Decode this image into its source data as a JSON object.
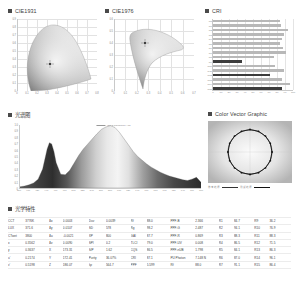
{
  "panels": {
    "cie1931": {
      "title": "CIE1931"
    },
    "cie1976": {
      "title": "CIE1976"
    },
    "cri": {
      "title": "CRI"
    },
    "spectrum": {
      "title": "光谱图"
    },
    "color_vector": {
      "title": "Color Vector Graphic"
    },
    "photometric": {
      "title": "光学特性"
    }
  },
  "cie1931_axes": {
    "xticks": [
      "0",
      "0.1",
      "0.2",
      "0.3",
      "0.4",
      "0.5",
      "0.6",
      "0.7",
      "0.8"
    ],
    "yticks": [
      "0.9",
      "0.8",
      "0.7",
      "0.6",
      "0.5",
      "0.4",
      "0.3",
      "0.2",
      "0.1",
      "0"
    ],
    "point": {
      "x": 0.3562,
      "y": 0.3637
    }
  },
  "cie1976_axes": {
    "xticks": [
      "0",
      "0.1",
      "0.2",
      "0.3",
      "0.4",
      "0.5",
      "0.6",
      "0.7"
    ],
    "yticks": [
      "0.6",
      "0.5",
      "0.4",
      "0.3",
      "0.2",
      "0.1",
      "0"
    ],
    "point": {
      "u": 0.2174,
      "v": 0.5198
    }
  },
  "chart_data": [
    {
      "type": "bar",
      "title": "CRI",
      "orientation": "horizontal",
      "categories": [
        "Ra",
        "R1",
        "R2",
        "R3",
        "R4",
        "R5",
        "R6",
        "R7",
        "R8",
        "R9",
        "R10",
        "R11",
        "R12",
        "R13",
        "R14",
        "R15"
      ],
      "values": [
        84.2,
        84.7,
        94.1,
        88.3,
        86.5,
        84.1,
        87.0,
        91.1,
        75.8,
        36.2,
        76.9,
        88.3,
        71.5,
        86.3,
        96.1,
        86.4
      ],
      "xlabel": "",
      "ylabel": "",
      "xlim": [
        0,
        100
      ],
      "xticks": [
        "0",
        "10",
        "20",
        "30",
        "40",
        "50",
        "60",
        "70",
        "80",
        "90",
        "100"
      ],
      "grid": true,
      "legend": ""
    },
    {
      "type": "area",
      "title": "光谱图",
      "series_label": "Nm = 0.2841907×12",
      "xlabel": "",
      "ylabel": "",
      "xlim": [
        380,
        780
      ],
      "ylim": [
        0,
        1
      ],
      "xticks": [
        "380",
        "400",
        "420",
        "440",
        "460",
        "480",
        "500",
        "520",
        "540",
        "560",
        "580",
        "600",
        "620",
        "640",
        "660",
        "680",
        "700",
        "720",
        "740",
        "760",
        "780"
      ],
      "yticks": [
        "1.0",
        "0.9",
        "0.8",
        "0.7",
        "0.6",
        "0.5",
        "0.4",
        "0.3",
        "0.2",
        "0.1",
        "0"
      ],
      "x": [
        380,
        390,
        400,
        410,
        420,
        430,
        440,
        445,
        450,
        455,
        460,
        470,
        480,
        490,
        500,
        510,
        520,
        530,
        540,
        550,
        560,
        570,
        580,
        590,
        600,
        610,
        620,
        630,
        640,
        650,
        660,
        670,
        680,
        690,
        700,
        710,
        720,
        730,
        740,
        750,
        760,
        770,
        780
      ],
      "values": [
        0.02,
        0.03,
        0.05,
        0.08,
        0.14,
        0.3,
        0.62,
        0.72,
        0.7,
        0.58,
        0.4,
        0.22,
        0.21,
        0.28,
        0.4,
        0.52,
        0.62,
        0.7,
        0.78,
        0.86,
        0.93,
        0.97,
        0.99,
        0.96,
        0.88,
        0.78,
        0.68,
        0.58,
        0.5,
        0.44,
        0.38,
        0.33,
        0.29,
        0.25,
        0.22,
        0.19,
        0.17,
        0.15,
        0.13,
        0.12,
        0.14,
        0.17,
        0.09
      ],
      "grid": false
    },
    {
      "type": "scatter",
      "title": "Color Vector Graphic",
      "legend": [
        "参考光源",
        "测试光源"
      ],
      "points": 16,
      "grid": true
    }
  ],
  "photometric_table": {
    "rows": [
      [
        {
          "k": "CCT",
          "v": "3776K"
        },
        {
          "k": "Δx",
          "v": "0.0003"
        },
        {
          "k": "Duv",
          "v": "0.0039"
        },
        {
          "k": "Rf",
          "v": "88.0"
        },
        {
          "k": "PPF-B",
          "v": "2.366"
        },
        {
          "k": "R1",
          "v": "84.7"
        },
        {
          "k": "R9",
          "v": "36.2"
        }
      ],
      [
        {
          "k": "LUX",
          "v": "371.6"
        },
        {
          "k": "Δy",
          "v": "0.0107"
        },
        {
          "k": "SD",
          "v": "578"
        },
        {
          "k": "Rg",
          "v": "98.2"
        },
        {
          "k": "PPF-G",
          "v": "2.487"
        },
        {
          "k": "R2",
          "v": "94.1"
        },
        {
          "k": "R10",
          "v": "76.9"
        }
      ],
      [
        {
          "k": "CTwet",
          "v": "3800"
        },
        {
          "k": "Δu",
          "v": "-0.0021"
        },
        {
          "k": "XP",
          "v": "800"
        },
        {
          "k": "GAI",
          "v": "87.7"
        },
        {
          "k": "PPF-R",
          "v": "0.869"
        },
        {
          "k": "R3",
          "v": "88.3"
        },
        {
          "k": "R11",
          "v": "88.3"
        }
      ],
      [
        {
          "k": "x",
          "v": "0.3562"
        },
        {
          "k": "Δv",
          "v": "0.0090"
        },
        {
          "k": "SPI",
          "v": "0.2"
        },
        {
          "k": "TLCI",
          "v": "79.0"
        },
        {
          "k": "PPF-UV",
          "v": "0.008"
        },
        {
          "k": "R4",
          "v": "86.5"
        },
        {
          "k": "R12",
          "v": "71.5"
        }
      ],
      [
        {
          "k": "y",
          "v": "0.3637"
        },
        {
          "k": "X",
          "v": "173.31"
        },
        {
          "k": "S/P",
          "v": "1.62"
        },
        {
          "k": "CQS",
          "v": "86.5"
        },
        {
          "k": "PPF-nUB",
          "v": "1.798"
        },
        {
          "k": "R5",
          "v": "84.1"
        },
        {
          "k": "R13",
          "v": "86.3"
        }
      ],
      [
        {
          "k": "u'",
          "v": "0.2174"
        },
        {
          "k": "Y",
          "v": "172.41"
        },
        {
          "k": "Purity",
          "v": "36.07%"
        },
        {
          "k": "CRI",
          "v": "87.1"
        },
        {
          "k": "PU Photon",
          "v": "7.148 N"
        },
        {
          "k": "R6",
          "v": "87.0"
        },
        {
          "k": "R14",
          "v": "96.1"
        }
      ],
      [
        {
          "k": "v'",
          "v": "0.5198"
        },
        {
          "k": "Z",
          "v": "186.07"
        },
        {
          "k": "λp",
          "v": "564.7"
        },
        {
          "k": "PPF",
          "v": "5.599"
        },
        {
          "k": "Rf",
          "v": "88.0"
        },
        {
          "k": "R7",
          "v": "91.1"
        },
        {
          "k": "R15",
          "v": "86.4"
        }
      ]
    ]
  }
}
